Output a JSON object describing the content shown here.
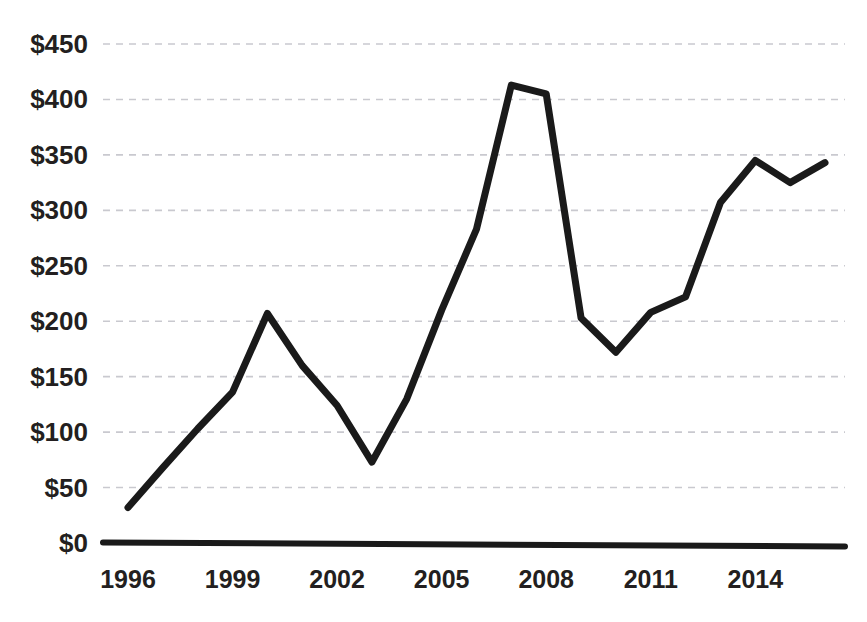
{
  "chart_data": {
    "type": "line",
    "title": "",
    "subtitle": "",
    "xlabel": "",
    "ylabel": "",
    "grid": true,
    "legend": null,
    "xlim": [
      1996,
      2016
    ],
    "ylim": [
      0,
      450
    ],
    "y_tick_labels": [
      "$450",
      "$400",
      "$350",
      "$300",
      "$250",
      "$200",
      "$150",
      "$100",
      "$50",
      "$0"
    ],
    "y_tick_values": [
      450,
      400,
      350,
      300,
      250,
      200,
      150,
      100,
      50,
      0
    ],
    "x_tick_labels": [
      "1996",
      "1999",
      "2002",
      "2005",
      "2008",
      "2011",
      "2014"
    ],
    "x_tick_values": [
      1996,
      1999,
      2002,
      2005,
      2008,
      2011,
      2014
    ],
    "x": [
      1996,
      1997,
      1998,
      1999,
      2000,
      2001,
      2002,
      2003,
      2004,
      2005,
      2006,
      2007,
      2008,
      2009,
      2010,
      2011,
      2012,
      2013,
      2014,
      2015,
      2016
    ],
    "series": [
      {
        "name": "value",
        "color": "#1a1a1a",
        "values": [
          32,
          68,
          103,
          136,
          207,
          160,
          124,
          73,
          130,
          210,
          283,
          413,
          405,
          203,
          172,
          208,
          222,
          307,
          345,
          325,
          343
        ]
      }
    ]
  },
  "axes": {
    "y_axis_name": "dollar-value-axis",
    "x_axis_name": "year-axis",
    "baseline_label": "$0"
  }
}
